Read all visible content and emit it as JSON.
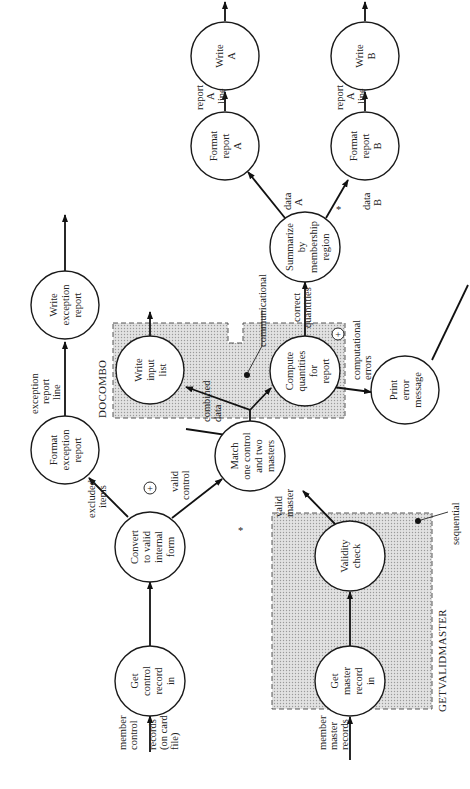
{
  "diagram": {
    "type": "structure chart / data flow (rotated 90° counter-clockwise)",
    "groups": [
      {
        "id": "docombo",
        "title": "DOCOMBO",
        "annotation": "communicational"
      },
      {
        "id": "getvalidmaster",
        "title": "GETVALIDMASTER",
        "annotation": "sequential"
      }
    ],
    "nodes": {
      "get_control": {
        "lines": [
          "Get",
          "control",
          "record",
          "in"
        ]
      },
      "convert": {
        "lines": [
          "Convert",
          "to valid",
          "internal",
          "form"
        ]
      },
      "format_exception": {
        "lines": [
          "Format",
          "exception",
          "report"
        ]
      },
      "write_exception": {
        "lines": [
          "Write",
          "exception",
          "report"
        ]
      },
      "match": {
        "lines": [
          "Match",
          "one control",
          "and two",
          "masters"
        ]
      },
      "write_input": {
        "lines": [
          "Write",
          "input",
          "list"
        ]
      },
      "compute": {
        "lines": [
          "Compute",
          "quantities",
          "for",
          "report"
        ]
      },
      "summarize": {
        "lines": [
          "Summarize",
          "by",
          "membership",
          "region"
        ]
      },
      "format_a": {
        "lines": [
          "Format",
          "report",
          "A"
        ]
      },
      "write_a": {
        "lines": [
          "Write",
          "A"
        ]
      },
      "format_b": {
        "lines": [
          "Format",
          "report",
          "B"
        ]
      },
      "write_b": {
        "lines": [
          "Write",
          "B"
        ]
      },
      "print_error": {
        "lines": [
          "Print",
          "error",
          "message"
        ]
      },
      "validity": {
        "lines": [
          "Validity",
          "check"
        ]
      },
      "get_master": {
        "lines": [
          "Get",
          "master",
          "record",
          "in"
        ]
      }
    },
    "edge_labels": {
      "member_control": [
        "member",
        "control",
        "records",
        "(on card",
        "file)"
      ],
      "member_master": [
        "member",
        "master",
        "records"
      ],
      "excluded_items": [
        "excluded",
        "items"
      ],
      "valid_control": [
        "valid",
        "control"
      ],
      "valid_master": [
        "valid",
        "master"
      ],
      "exception_line": [
        "exception",
        "report",
        "line"
      ],
      "combined_data": [
        "combined",
        "data"
      ],
      "correct_quantities": [
        "correct",
        "quantities"
      ],
      "computational_errors": [
        "computational",
        "errors"
      ],
      "data_a": [
        "data",
        "A"
      ],
      "data_b": [
        "data",
        "B"
      ],
      "report_a_line": [
        "report",
        "A",
        "line"
      ],
      "report_a_line_b": [
        "report",
        "A",
        "line"
      ]
    },
    "symbols": {
      "exclusive_or": "+",
      "iteration_mark": "*"
    }
  }
}
